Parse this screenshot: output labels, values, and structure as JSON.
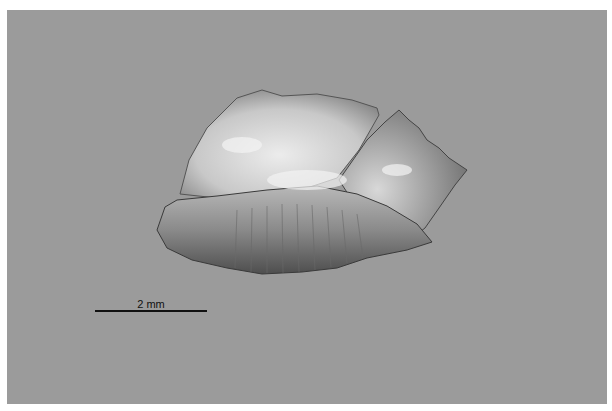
{
  "image": {
    "subject": "specimen photograph on gray background",
    "background_color": "#9b9b9b",
    "border_color": "#ffffff"
  },
  "scale_bar": {
    "label": "2 mm",
    "color": "#111111"
  }
}
